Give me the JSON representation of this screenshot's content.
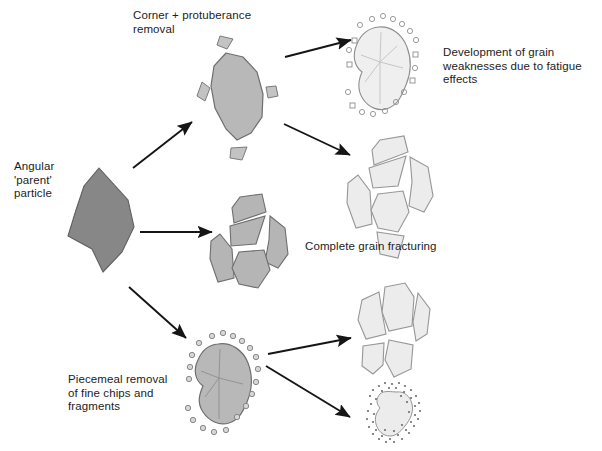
{
  "diagram": {
    "type": "process-flow-diagram",
    "background_color": "#ffffff",
    "line_color": "#1a1a1a",
    "labels": {
      "parent_particle": "Angular\n'parent'\nparticle",
      "corner_removal": "Corner + protuberance\nremoval",
      "fatigue_weakness": "Development of grain\nweaknesses due to fatigue\neffects",
      "complete_fracturing": "Complete grain fracturing",
      "piecemeal_removal": "Piecemeal removal\nof fine chips and\nfragments"
    },
    "shapes": [
      {
        "name": "angular-parent-particle",
        "stage": "parent",
        "fill": "#878787",
        "stroke": "#5a5a5a",
        "description": "dark grey angular polygon"
      },
      {
        "name": "corner-protuberance-removed-grain",
        "stage": "branch-1",
        "fill": "#b8b8b8",
        "stroke": "#6e6e6e",
        "description": "rounded mid-grey grain with detached corner chips"
      },
      {
        "name": "fatigue-weakened-grain",
        "stage": "branch-1-a",
        "fill": "#efefef",
        "stroke": "#9a9a9a",
        "description": "pale grain with internal crack traces and small shed particles"
      },
      {
        "name": "fractured-grain-fragments-upper",
        "stage": "branch-1-b",
        "fill": "#ececec",
        "stroke": "#9a9a9a",
        "description": "pale grain fully broken into angular fragments"
      },
      {
        "name": "fractured-grain-mid",
        "stage": "branch-2",
        "fill": "#b5b5b5",
        "stroke": "#6e6e6e",
        "description": "mid-grey grain split into angular fragments"
      },
      {
        "name": "piecemeal-abraded-grain",
        "stage": "branch-3",
        "fill": "#b8b8b8",
        "stroke": "#6e6e6e",
        "description": "rounded mid-grey grain with halo of fine chips"
      },
      {
        "name": "quartered-fractured-grain",
        "stage": "branch-3-a",
        "fill": "#ececec",
        "stroke": "#9a9a9a",
        "description": "pale grain split into four quadrants"
      },
      {
        "name": "rounded-grain-with-fines-halo",
        "stage": "branch-3-b",
        "fill": "#ececec",
        "stroke": "#9a9a9a",
        "description": "small pale rounded grain with dense halo of fine specks"
      }
    ],
    "arrows": [
      {
        "name": "arrow-parent-to-corner-removal",
        "from": "angular-parent-particle",
        "to": "corner-protuberance-removed-grain"
      },
      {
        "name": "arrow-parent-to-fracturing",
        "from": "angular-parent-particle",
        "to": "fractured-grain-mid"
      },
      {
        "name": "arrow-parent-to-piecemeal",
        "from": "angular-parent-particle",
        "to": "piecemeal-abraded-grain"
      },
      {
        "name": "arrow-corner-to-fatigue",
        "from": "corner-protuberance-removed-grain",
        "to": "fatigue-weakened-grain"
      },
      {
        "name": "arrow-corner-to-fragments",
        "from": "corner-protuberance-removed-grain",
        "to": "fractured-grain-fragments-upper"
      },
      {
        "name": "arrow-piecemeal-to-quartered",
        "from": "piecemeal-abraded-grain",
        "to": "quartered-fractured-grain"
      },
      {
        "name": "arrow-piecemeal-to-fines",
        "from": "piecemeal-abraded-grain",
        "to": "rounded-grain-with-fines-halo"
      }
    ]
  }
}
